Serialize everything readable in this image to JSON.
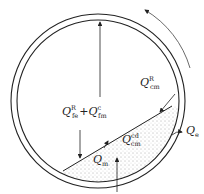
{
  "diagram": {
    "rotation_direction": "counterclockwise",
    "colors": {
      "stroke": "#222222",
      "fill_bed": "#ffffff",
      "dots": "#555555"
    },
    "labels": {
      "gas_to_wall": {
        "main": "Q",
        "sup": "R",
        "sub": "fe",
        "plus": "+",
        "main2": "Q",
        "sup2": "c",
        "sub2": "fm"
      },
      "wall_to_solid_radiation": {
        "main": "Q",
        "sup": "R",
        "sub": "cm"
      },
      "wall_to_solid_conduction": {
        "main": "Q",
        "sup": "cd",
        "sub": "cm"
      },
      "bed_heat": {
        "main": "Q",
        "sub": "m"
      },
      "shell_loss": {
        "main": "Q",
        "sub": "e"
      }
    }
  }
}
